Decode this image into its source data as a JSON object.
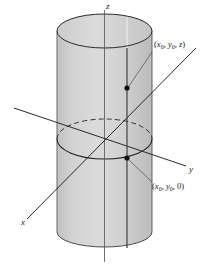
{
  "figure": {
    "type": "geometry-diagram",
    "background_color": "#ffffff",
    "ink_color": "#1a1a1a"
  },
  "axes": {
    "z": {
      "label": "z",
      "x": 108,
      "y": 4,
      "description": "vertical axis through top of cylinder"
    },
    "y": {
      "label": "y",
      "x": 190,
      "y": 168,
      "description": "axis toward lower right"
    },
    "x": {
      "label": "x",
      "x": 22,
      "y": 222,
      "description": "axis toward lower left"
    }
  },
  "points": [
    {
      "name": "upper-point",
      "label_open": "(",
      "x_sym": "x",
      "x_sub": "0",
      "comma1": ", ",
      "y_sym": "y",
      "y_sub": "0",
      "comma2": ", ",
      "z_sym": "z",
      "label_close": ")",
      "label_x": 154,
      "label_y": 44,
      "dot_x": 127,
      "dot_y": 88
    },
    {
      "name": "lower-point",
      "label_open": "(",
      "x_sym": "x",
      "x_sub": "0",
      "comma1": ", ",
      "y_sym": "y",
      "y_sub": "0",
      "comma2": ", ",
      "z_sym": "0",
      "label_close": ")",
      "label_x": 152,
      "label_y": 186,
      "dot_x": 127,
      "dot_y": 158
    }
  ],
  "cylinder": {
    "left_edge_x": 57,
    "right_edge_x": 152,
    "center_x": 104.5,
    "top_ellipse_cy": 31,
    "top_ellipse_rx": 47.5,
    "top_ellipse_ry": 17,
    "bottom_cy": 232,
    "bottom_ry": 15,
    "mid_ellipse_cy": 139,
    "mid_ellipse_rx": 47.5,
    "mid_ellipse_ry": 20,
    "hatch_color": "#9a9a9a",
    "hatch_count": 47,
    "generator_line_x": 127,
    "outline_color": "#1a1a1a"
  }
}
